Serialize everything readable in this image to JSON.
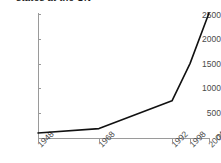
{
  "chart_data": {
    "type": "line",
    "title": "states at the UN",
    "xlabel": "",
    "ylabel": "",
    "x": [
      1948,
      1968,
      1992,
      1998,
      2004
    ],
    "categories": [
      "1948",
      "1968",
      "1992",
      "1998",
      "2004"
    ],
    "values": [
      100,
      190,
      750,
      1500,
      2520
    ],
    "series": [
      {
        "name": "states at the UN",
        "values": [
          100,
          190,
          750,
          1500,
          2520
        ]
      }
    ],
    "ylim": [
      0,
      2500
    ],
    "xlim": [
      1948,
      2004
    ],
    "yticks": [
      "0",
      "500",
      "1000",
      "1500",
      "2000",
      "2500"
    ],
    "ytick_values": [
      0,
      500,
      1000,
      1500,
      2000,
      2500
    ],
    "xticks": [
      "1948",
      "1968",
      "1992",
      "1998",
      "2004"
    ],
    "grid": false,
    "legend": false,
    "legend_position": "none",
    "line_color": "#111111",
    "axis_color": "#9a9a9a",
    "background": "#ffffff"
  },
  "axes": {
    "y": [
      {
        "label": "2500",
        "value": 2500
      },
      {
        "label": "2000",
        "value": 2000
      },
      {
        "label": "1500",
        "value": 1500
      },
      {
        "label": "1000",
        "value": 1000
      },
      {
        "label": "500",
        "value": 500
      },
      {
        "label": "0",
        "value": 0
      }
    ],
    "x": [
      {
        "label": "1948",
        "value": 1948
      },
      {
        "label": "1968",
        "value": 1968
      },
      {
        "label": "1992",
        "value": 1992
      },
      {
        "label": "1998",
        "value": 1998
      },
      {
        "label": "2004",
        "value": 2004
      }
    ]
  }
}
